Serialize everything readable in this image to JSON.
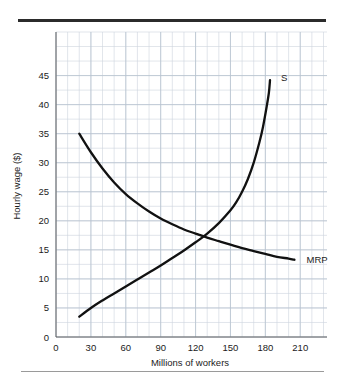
{
  "figure": {
    "top_rule_color": "#2b2b2b",
    "bottom_rule_color": "#9a9a9a",
    "background_color": "#ffffff",
    "grid_color": "#ccd4dd",
    "curve_color": "#111111"
  },
  "chart_data": {
    "type": "line",
    "title": "",
    "xlabel": "Millions of workers",
    "ylabel": "Hourly wage ($)",
    "xlim": [
      0,
      233
    ],
    "ylim": [
      0,
      52.5
    ],
    "xticks": [
      0,
      30,
      60,
      90,
      120,
      150,
      180,
      210
    ],
    "yticks": [
      0,
      5,
      10,
      15,
      20,
      25,
      30,
      35,
      40,
      45
    ],
    "xtick_labels": [
      "0",
      "30",
      "60",
      "90",
      "120",
      "150",
      "180",
      "210"
    ],
    "ytick_labels": [
      "0",
      "5",
      "10",
      "15",
      "20",
      "25",
      "30",
      "35",
      "40",
      "45"
    ],
    "grid": true,
    "grid_minor_step_x": 10,
    "grid_minor_step_y": 2.5,
    "legend": "inline-labels",
    "series": [
      {
        "name": "MRP",
        "label": "MRP",
        "label_x": 212,
        "label_y": 13.3,
        "points": [
          [
            20,
            35.0
          ],
          [
            30,
            31.8
          ],
          [
            40,
            29.0
          ],
          [
            50,
            26.6
          ],
          [
            60,
            24.6
          ],
          [
            70,
            23.0
          ],
          [
            80,
            21.6
          ],
          [
            90,
            20.4
          ],
          [
            100,
            19.4
          ],
          [
            110,
            18.5
          ],
          [
            120,
            17.8
          ],
          [
            130,
            17.1
          ],
          [
            140,
            16.5
          ],
          [
            150,
            15.9
          ],
          [
            160,
            15.3
          ],
          [
            170,
            14.8
          ],
          [
            180,
            14.3
          ],
          [
            190,
            13.8
          ],
          [
            200,
            13.5
          ],
          [
            205,
            13.3
          ]
        ]
      },
      {
        "name": "S",
        "label": "S",
        "label_x": 190,
        "label_y": 44.6,
        "points": [
          [
            20,
            3.5
          ],
          [
            30,
            5.0
          ],
          [
            40,
            6.3
          ],
          [
            50,
            7.5
          ],
          [
            60,
            8.7
          ],
          [
            70,
            9.9
          ],
          [
            80,
            11.1
          ],
          [
            90,
            12.3
          ],
          [
            100,
            13.6
          ],
          [
            110,
            14.9
          ],
          [
            120,
            16.3
          ],
          [
            130,
            17.8
          ],
          [
            140,
            19.6
          ],
          [
            150,
            21.8
          ],
          [
            155,
            23.2
          ],
          [
            160,
            25.0
          ],
          [
            165,
            27.2
          ],
          [
            170,
            30.0
          ],
          [
            175,
            33.6
          ],
          [
            178,
            36.2
          ],
          [
            181,
            39.5
          ],
          [
            183,
            42.0
          ],
          [
            184,
            44.2
          ]
        ]
      }
    ],
    "intersection": {
      "x": 140,
      "y": 17.5
    }
  }
}
